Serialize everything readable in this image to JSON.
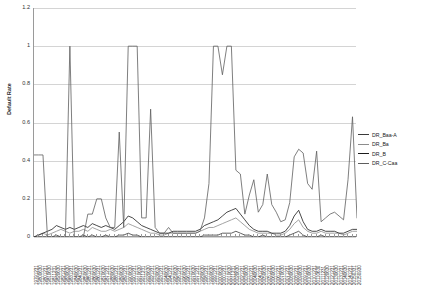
{
  "chart_data": {
    "type": "line",
    "title": "",
    "xlabel": "",
    "ylabel": "Default Rate",
    "ylim": [
      0,
      1.2
    ],
    "yticks": [
      0,
      0.2,
      0.4,
      0.6,
      0.8,
      1,
      1.2
    ],
    "ytick_labels": [
      "0",
      "0.2",
      "0.4",
      "0.6",
      "0.8",
      "1",
      "1.2"
    ],
    "grid": true,
    "legend_position": "right",
    "categories": [
      "19791231",
      "19800630",
      "19801231",
      "19810630",
      "19811231",
      "19820630",
      "19821231",
      "19830630",
      "19831231",
      "19840630",
      "19841231",
      "19850630",
      "19851231",
      "19860630",
      "19861231",
      "19870630",
      "19871231",
      "19880630",
      "19881231",
      "19890630",
      "19891231",
      "19900630",
      "19901231",
      "19910630",
      "19911231",
      "19920630",
      "19921231",
      "19930630",
      "19931231",
      "19940630",
      "19941231",
      "19950630",
      "19951231",
      "19960630",
      "19961231",
      "19970630",
      "19971231",
      "19980630",
      "19981231",
      "19990630",
      "19991231",
      "20000630",
      "20001231",
      "20010630",
      "20011231",
      "20020630",
      "20021231",
      "20030630",
      "20031231",
      "20040630",
      "20041231",
      "20050630",
      "20051231",
      "20060630",
      "20061231",
      "20070630",
      "20071231",
      "20080630",
      "20081231",
      "20090630",
      "20091231",
      "20100630",
      "20101231",
      "20110630",
      "20111231",
      "20120630",
      "20121231",
      "20130630",
      "20131231",
      "20140630",
      "20141231",
      "20150331",
      "20150930"
    ],
    "series": [
      {
        "name": "DR_Baa-A",
        "color": "#3a3a3a",
        "values": [
          0.0,
          0.0,
          0.0,
          0.0,
          0.0,
          0.01,
          0.0,
          0.0,
          0.0,
          0.0,
          0.0,
          0.01,
          0.0,
          0.01,
          0.0,
          0.0,
          0.01,
          0.0,
          0.0,
          0.01,
          0.01,
          0.02,
          0.01,
          0.01,
          0.0,
          0.0,
          0.0,
          0.0,
          0.0,
          0.0,
          0.0,
          0.0,
          0.0,
          0.0,
          0.0,
          0.0,
          0.0,
          0.0,
          0.01,
          0.01,
          0.01,
          0.01,
          0.02,
          0.02,
          0.02,
          0.03,
          0.02,
          0.01,
          0.01,
          0.0,
          0.0,
          0.01,
          0.0,
          0.0,
          0.0,
          0.0,
          0.0,
          0.01,
          0.02,
          0.03,
          0.01,
          0.0,
          0.0,
          0.0,
          0.01,
          0.0,
          0.0,
          0.0,
          0.0,
          0.0,
          0.0,
          0.0,
          0.0
        ]
      },
      {
        "name": "DR_Ba",
        "color": "#8c8c8c",
        "values": [
          0.0,
          0.01,
          0.02,
          0.01,
          0.02,
          0.03,
          0.04,
          0.03,
          0.02,
          0.03,
          0.03,
          0.04,
          0.03,
          0.05,
          0.04,
          0.03,
          0.03,
          0.04,
          0.03,
          0.04,
          0.05,
          0.07,
          0.06,
          0.05,
          0.04,
          0.03,
          0.02,
          0.02,
          0.01,
          0.01,
          0.02,
          0.02,
          0.02,
          0.02,
          0.02,
          0.02,
          0.02,
          0.03,
          0.04,
          0.05,
          0.05,
          0.06,
          0.07,
          0.08,
          0.09,
          0.1,
          0.08,
          0.06,
          0.04,
          0.03,
          0.02,
          0.02,
          0.02,
          0.02,
          0.01,
          0.01,
          0.02,
          0.04,
          0.07,
          0.09,
          0.05,
          0.03,
          0.02,
          0.02,
          0.03,
          0.02,
          0.02,
          0.02,
          0.02,
          0.01,
          0.02,
          0.03,
          0.03
        ]
      },
      {
        "name": "DR_B",
        "color": "#1c1c1c",
        "values": [
          0.0,
          0.01,
          0.02,
          0.03,
          0.04,
          0.06,
          0.05,
          0.04,
          0.05,
          0.04,
          0.05,
          0.06,
          0.05,
          0.07,
          0.06,
          0.05,
          0.06,
          0.05,
          0.04,
          0.06,
          0.08,
          0.11,
          0.1,
          0.08,
          0.06,
          0.05,
          0.04,
          0.03,
          0.02,
          0.02,
          0.02,
          0.03,
          0.03,
          0.03,
          0.03,
          0.03,
          0.03,
          0.04,
          0.06,
          0.07,
          0.08,
          0.09,
          0.11,
          0.13,
          0.14,
          0.15,
          0.12,
          0.09,
          0.06,
          0.04,
          0.03,
          0.03,
          0.03,
          0.02,
          0.02,
          0.02,
          0.03,
          0.06,
          0.11,
          0.14,
          0.08,
          0.04,
          0.03,
          0.03,
          0.04,
          0.03,
          0.03,
          0.03,
          0.02,
          0.02,
          0.03,
          0.04,
          0.04
        ]
      },
      {
        "name": "DR_C-Caa",
        "color": "#5e5e5e",
        "values": [
          0.43,
          0.43,
          0.43,
          0.0,
          0.0,
          0.0,
          0.0,
          0.0,
          1.0,
          0.0,
          0.0,
          0.0,
          0.12,
          0.12,
          0.2,
          0.2,
          0.1,
          0.05,
          0.05,
          0.55,
          0.05,
          1.0,
          1.0,
          1.0,
          0.1,
          0.1,
          0.67,
          0.05,
          0.02,
          0.02,
          0.05,
          0.02,
          0.02,
          0.02,
          0.02,
          0.02,
          0.02,
          0.03,
          0.1,
          0.28,
          1.0,
          1.0,
          0.85,
          1.0,
          1.0,
          0.35,
          0.33,
          0.12,
          0.22,
          0.3,
          0.13,
          0.17,
          0.33,
          0.17,
          0.13,
          0.08,
          0.09,
          0.18,
          0.42,
          0.46,
          0.44,
          0.28,
          0.25,
          0.45,
          0.08,
          0.1,
          0.12,
          0.13,
          0.11,
          0.09,
          0.3,
          0.63,
          0.1
        ]
      }
    ]
  },
  "legend": {
    "items": [
      {
        "label": "DR_Baa-A"
      },
      {
        "label": "DR_Ba"
      },
      {
        "label": "DR_B"
      },
      {
        "label": "DR_C-Caa"
      }
    ]
  }
}
